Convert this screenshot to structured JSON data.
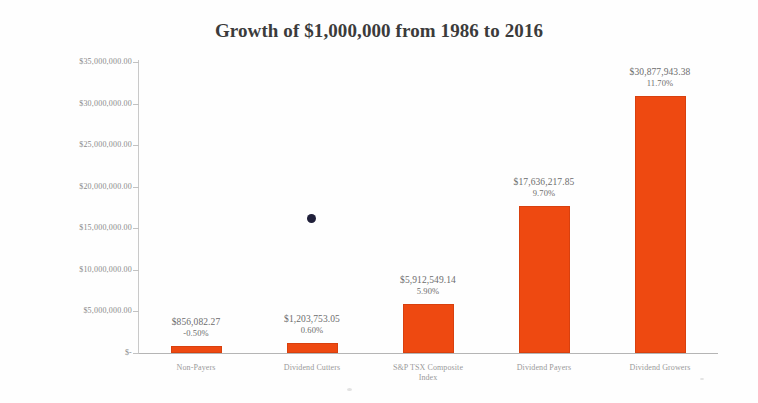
{
  "chart_data": {
    "type": "bar",
    "title": "Growth of $1,000,000 from 1986 to 2016",
    "xlabel": "",
    "ylabel": "",
    "grid": false,
    "legend": "none",
    "ylim": [
      0,
      35000000
    ],
    "categories": [
      "Non-Payers",
      "Dividend Cutters",
      "S&P TSX Composite Index",
      "Dividend Payers",
      "Dividend Growers"
    ],
    "values": [
      856082.27,
      1203753.05,
      5912549.14,
      17636217.85,
      30877943.38
    ],
    "value_labels": [
      "$856,082.27",
      "$1,203,753.05",
      "$5,912,549.14",
      "$17,636,217.85",
      "$30,877,943.38"
    ],
    "pct_labels": [
      "-0.50%",
      "0.60%",
      "5.90%",
      "9.70%",
      "11.70%"
    ],
    "pct_values": [
      -0.5,
      0.6,
      5.9,
      9.7,
      11.7
    ],
    "ytick_values": [
      35000000,
      30000000,
      25000000,
      20000000,
      15000000,
      10000000,
      5000000,
      0
    ],
    "ytick_labels": [
      "$35,000,000.00",
      "$30,000,000.00",
      "$25,000,000.00",
      "$20,000,000.00",
      "$15,000,000.00",
      "$10,000,000.00",
      "$5,000,000.00",
      "$-"
    ],
    "bar_color": "#ee4911"
  },
  "category_lines": [
    [
      "Non-Payers"
    ],
    [
      "Dividend Cutters"
    ],
    [
      "S&P TSX Composite",
      "Index"
    ],
    [
      "Dividend Payers"
    ],
    [
      "Dividend Growers"
    ]
  ]
}
